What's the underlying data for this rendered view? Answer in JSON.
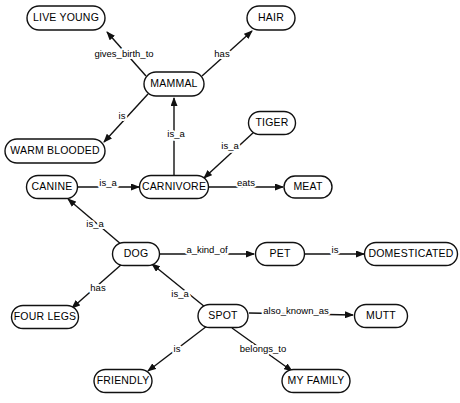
{
  "diagram": {
    "colors": {
      "background": "#ffffff",
      "stroke": "#111111",
      "text": "#000000"
    },
    "nodes": [
      {
        "id": "live_young",
        "label": "LIVE YOUNG",
        "cx": 66,
        "cy": 18,
        "w": 78,
        "h": 24
      },
      {
        "id": "hair",
        "label": "HAIR",
        "cx": 271,
        "cy": 18,
        "w": 48,
        "h": 24
      },
      {
        "id": "mammal",
        "label": "MAMMAL",
        "cx": 174,
        "cy": 84,
        "w": 60,
        "h": 24
      },
      {
        "id": "tiger",
        "label": "TIGER",
        "cx": 272,
        "cy": 123,
        "w": 47,
        "h": 23
      },
      {
        "id": "warm_blooded",
        "label": "WARM BLOODED",
        "cx": 55,
        "cy": 151,
        "w": 100,
        "h": 24
      },
      {
        "id": "canine",
        "label": "CANINE",
        "cx": 52,
        "cy": 187,
        "w": 51,
        "h": 23
      },
      {
        "id": "carnivore",
        "label": "CARNIVORE",
        "cx": 174,
        "cy": 187,
        "w": 69,
        "h": 23
      },
      {
        "id": "meat",
        "label": "MEAT",
        "cx": 308,
        "cy": 187,
        "w": 48,
        "h": 22
      },
      {
        "id": "dog",
        "label": "DOG",
        "cx": 136,
        "cy": 254,
        "w": 47,
        "h": 23
      },
      {
        "id": "pet",
        "label": "PET",
        "cx": 280,
        "cy": 254,
        "w": 49,
        "h": 23
      },
      {
        "id": "domesticated",
        "label": "DOMESTICATED",
        "cx": 411,
        "cy": 254,
        "w": 93,
        "h": 23
      },
      {
        "id": "four_legs",
        "label": "FOUR LEGS",
        "cx": 45,
        "cy": 317,
        "w": 67,
        "h": 23
      },
      {
        "id": "spot",
        "label": "SPOT",
        "cx": 223,
        "cy": 316,
        "w": 50,
        "h": 23
      },
      {
        "id": "mutt",
        "label": "MUTT",
        "cx": 381,
        "cy": 316,
        "w": 53,
        "h": 23
      },
      {
        "id": "friendly",
        "label": "FRIENDLY",
        "cx": 123,
        "cy": 381,
        "w": 58,
        "h": 23
      },
      {
        "id": "my_family",
        "label": "MY FAMILY",
        "cx": 316,
        "cy": 381,
        "w": 68,
        "h": 23
      }
    ],
    "edges": [
      {
        "id": "mammal-gives_birth_to-live_young",
        "label": "gives_birth_to",
        "from": "mammal",
        "to": "live_young",
        "x1": 146,
        "y1": 76,
        "x2": 107,
        "y2": 32,
        "lx": 124,
        "ly": 54,
        "arrow": true
      },
      {
        "id": "mammal-has-hair",
        "label": "has",
        "from": "mammal",
        "to": "hair",
        "x1": 202,
        "y1": 76,
        "x2": 252,
        "y2": 31,
        "lx": 222,
        "ly": 54,
        "arrow": true
      },
      {
        "id": "mammal-is-warm_blooded",
        "label": "is",
        "from": "mammal",
        "to": "warm_blooded",
        "x1": 148,
        "y1": 94,
        "x2": 104,
        "y2": 142,
        "lx": 122,
        "ly": 116,
        "arrow": true
      },
      {
        "id": "carnivore-is_a-mammal",
        "label": "is_a",
        "from": "carnivore",
        "to": "mammal",
        "x1": 174,
        "y1": 176,
        "x2": 174,
        "y2": 98,
        "lx": 176,
        "ly": 134,
        "arrow": true
      },
      {
        "id": "tiger-is_a-carnivore",
        "label": "is_a",
        "from": "tiger",
        "to": "carnivore",
        "x1": 254,
        "y1": 132,
        "x2": 204,
        "y2": 178,
        "lx": 230,
        "ly": 146,
        "arrow": true
      },
      {
        "id": "canine-is_a-carnivore",
        "label": "is_a",
        "from": "canine",
        "to": "carnivore",
        "x1": 78,
        "y1": 187,
        "x2": 139,
        "y2": 187,
        "lx": 108,
        "ly": 183,
        "arrow": true
      },
      {
        "id": "carnivore-eats-meat",
        "label": "eats",
        "from": "carnivore",
        "to": "meat",
        "x1": 209,
        "y1": 187,
        "x2": 283,
        "y2": 187,
        "lx": 246,
        "ly": 183,
        "arrow": true
      },
      {
        "id": "dog-is_a-canine",
        "label": "is_a",
        "from": "dog",
        "to": "canine",
        "x1": 122,
        "y1": 245,
        "x2": 68,
        "y2": 199,
        "lx": 95,
        "ly": 224,
        "arrow": true
      },
      {
        "id": "dog-a_kind_of-pet",
        "label": "a_kind_of",
        "from": "dog",
        "to": "pet",
        "x1": 160,
        "y1": 254,
        "x2": 254,
        "y2": 254,
        "lx": 207,
        "ly": 250,
        "arrow": true
      },
      {
        "id": "pet-is-domesticated",
        "label": "is",
        "from": "pet",
        "to": "domesticated",
        "x1": 305,
        "y1": 254,
        "x2": 364,
        "y2": 254,
        "lx": 335,
        "ly": 250,
        "arrow": true
      },
      {
        "id": "dog-has-four_legs",
        "label": "has",
        "from": "dog",
        "to": "four_legs",
        "x1": 122,
        "y1": 264,
        "x2": 72,
        "y2": 308,
        "lx": 98,
        "ly": 288,
        "arrow": true
      },
      {
        "id": "spot-is_a-dog",
        "label": "is_a",
        "from": "spot",
        "to": "dog",
        "x1": 205,
        "y1": 307,
        "x2": 152,
        "y2": 264,
        "lx": 180,
        "ly": 294,
        "arrow": true
      },
      {
        "id": "spot-also_known_as-mutt",
        "label": "also_known_as",
        "from": "spot",
        "to": "mutt",
        "x1": 249,
        "y1": 313,
        "x2": 353,
        "y2": 315,
        "lx": 296,
        "ly": 311,
        "arrow": true
      },
      {
        "id": "spot-is-friendly",
        "label": "is",
        "from": "spot",
        "to": "friendly",
        "x1": 207,
        "y1": 326,
        "x2": 148,
        "y2": 371,
        "lx": 177,
        "ly": 349,
        "arrow": true
      },
      {
        "id": "spot-belongs_to-my_family",
        "label": "belongs_to",
        "from": "spot",
        "to": "my_family",
        "x1": 232,
        "y1": 328,
        "x2": 292,
        "y2": 371,
        "lx": 263,
        "ly": 349,
        "arrow": true
      }
    ]
  }
}
